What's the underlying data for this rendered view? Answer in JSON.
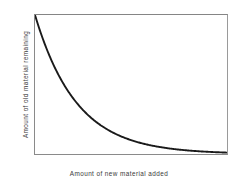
{
  "figure": {
    "background_color": "#ffffff",
    "frame_color": "#8a8a8a",
    "curve_color": "#1a1a1a"
  },
  "chart_data": {
    "type": "line",
    "title": "",
    "subtitle": "",
    "xlabel": "Amount of new material added",
    "ylabel": "Amount of old material remaining",
    "xlim": [
      0,
      1
    ],
    "ylim": [
      0,
      1
    ],
    "grid": false,
    "legend": null,
    "axis_ticks": {
      "x": [],
      "y": []
    },
    "annotations": [],
    "series": [
      {
        "name": "Old material remaining",
        "description": "Exponential decay, y = exp(-4.6x)",
        "color": "#1a1a1a",
        "line_width": 1.9,
        "x": [
          0,
          0.05,
          0.1,
          0.13,
          0.15,
          0.2,
          0.25,
          0.3,
          0.35,
          0.42,
          0.5,
          0.55,
          0.6,
          0.7,
          0.75,
          0.8,
          0.9,
          1
        ],
        "values": [
          1,
          0.794,
          0.631,
          0.551,
          0.501,
          0.398,
          0.316,
          0.251,
          0.2,
          0.145,
          0.1,
          0.079,
          0.063,
          0.04,
          0.032,
          0.025,
          0.016,
          0.01
        ]
      }
    ]
  }
}
